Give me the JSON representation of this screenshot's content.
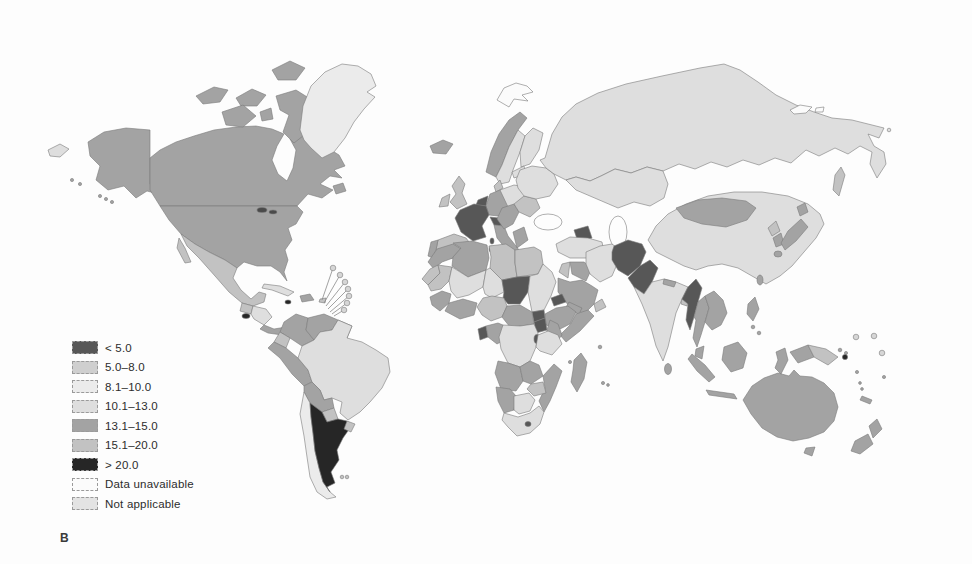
{
  "figure": {
    "panel_label": "B"
  },
  "legend": {
    "items": [
      {
        "label": "< 5.0",
        "color": "#575757"
      },
      {
        "label": "5.0–8.0",
        "color": "#cfcfcf"
      },
      {
        "label": "8.1–10.0",
        "color": "#ebebeb"
      },
      {
        "label": "10.1–13.0",
        "color": "#dedede"
      },
      {
        "label": "13.1–15.0",
        "color": "#a3a3a3"
      },
      {
        "label": "15.1–20.0",
        "color": "#c2c2c2"
      },
      {
        "label": "> 20.0",
        "color": "#262626"
      },
      {
        "label": "Data unavailable",
        "color": "#fbfbfb"
      },
      {
        "label": "Not applicable",
        "color": "#e3e3e3"
      }
    ]
  },
  "map": {
    "ocean_color": "#fdfdfd",
    "border_color": "#7a7a7a",
    "water": {
      "black_sea": "#fdfdfd",
      "caspian_sea": "#fdfdfd",
      "great_lakes": "#4a4a4a"
    },
    "markers": {
      "small_island_circle": {
        "fill": "#d6d6d6"
      },
      "dark_island_circle": {
        "fill": "#262626"
      }
    },
    "regions": {
      "alaska": {
        "name": "Alaska",
        "category": "13.1–15.0",
        "fill": "#a3a3a3"
      },
      "canada": {
        "name": "Canada",
        "category": "13.1–15.0",
        "fill": "#a3a3a3"
      },
      "arctic_islands": {
        "name": "Canadian Arctic islands",
        "category": "13.1–15.0",
        "fill": "#a3a3a3"
      },
      "greenland": {
        "name": "Greenland",
        "category": "8.1–10.0",
        "fill": "#ebebeb"
      },
      "usa": {
        "name": "United States",
        "category": "13.1–15.0",
        "fill": "#a3a3a3"
      },
      "mexico": {
        "name": "Mexico",
        "category": "15.1–20.0",
        "fill": "#c2c2c2"
      },
      "guatemala": {
        "name": "Guatemala",
        "category": "15.1–20.0",
        "fill": "#c2c2c2"
      },
      "el_salvador": {
        "name": "El Salvador",
        "category": "> 20.0",
        "fill": "#262626"
      },
      "honduras_nicaragua": {
        "name": "Honduras / Nicaragua",
        "category": "10.1–13.0",
        "fill": "#dedede"
      },
      "costa_rica_panama": {
        "name": "Costa Rica / Panama",
        "category": "13.1–15.0",
        "fill": "#a3a3a3"
      },
      "cuba": {
        "name": "Cuba",
        "category": "10.1–13.0",
        "fill": "#dedede"
      },
      "hispaniola": {
        "name": "Hispaniola",
        "category": "13.1–15.0",
        "fill": "#a3a3a3"
      },
      "jamaica": {
        "name": "Jamaica",
        "category": "> 20.0",
        "fill": "#262626"
      },
      "puerto_rico": {
        "name": "Puerto Rico",
        "category": "15.1–20.0",
        "fill": "#c2c2c2"
      },
      "colombia": {
        "name": "Colombia",
        "category": "13.1–15.0",
        "fill": "#a3a3a3"
      },
      "venezuela": {
        "name": "Venezuela",
        "category": "13.1–15.0",
        "fill": "#a3a3a3"
      },
      "guyanas": {
        "name": "Guyanas",
        "category": "13.1–15.0",
        "fill": "#a3a3a3"
      },
      "ecuador": {
        "name": "Ecuador",
        "category": "15.1–20.0",
        "fill": "#c2c2c2"
      },
      "peru": {
        "name": "Peru",
        "category": "13.1–15.0",
        "fill": "#a3a3a3"
      },
      "brazil": {
        "name": "Brazil",
        "category": "10.1–13.0",
        "fill": "#dedede"
      },
      "bolivia": {
        "name": "Bolivia",
        "category": "13.1–15.0",
        "fill": "#a3a3a3"
      },
      "paraguay": {
        "name": "Paraguay",
        "category": "15.1–20.0",
        "fill": "#c2c2c2"
      },
      "chile": {
        "name": "Chile",
        "category": "8.1–10.0",
        "fill": "#ebebeb"
      },
      "argentina": {
        "name": "Argentina",
        "category": "> 20.0",
        "fill": "#262626"
      },
      "uruguay": {
        "name": "Uruguay",
        "category": "15.1–20.0",
        "fill": "#c2c2c2"
      },
      "falklands": {
        "name": "Falkland Islands",
        "category": "15.1–20.0",
        "fill": "#c2c2c2"
      },
      "iceland": {
        "name": "Iceland",
        "category": "13.1–15.0",
        "fill": "#a3a3a3"
      },
      "svalbard": {
        "name": "Svalbard",
        "category": "Data unavailable",
        "fill": "#fbfbfb"
      },
      "uk": {
        "name": "United Kingdom",
        "category": "15.1–20.0",
        "fill": "#c2c2c2"
      },
      "ireland": {
        "name": "Ireland",
        "category": "15.1–20.0",
        "fill": "#c2c2c2"
      },
      "norway": {
        "name": "Norway",
        "category": "13.1–15.0",
        "fill": "#a3a3a3"
      },
      "sweden": {
        "name": "Sweden",
        "category": "10.1–13.0",
        "fill": "#dedede"
      },
      "finland": {
        "name": "Finland",
        "category": "10.1–13.0",
        "fill": "#dedede"
      },
      "denmark": {
        "name": "Denmark",
        "category": "15.1–20.0",
        "fill": "#c2c2c2"
      },
      "france": {
        "name": "France",
        "category": "< 5.0",
        "fill": "#575757"
      },
      "benelux": {
        "name": "Belgium / Netherlands",
        "category": "< 5.0",
        "fill": "#575757"
      },
      "germany": {
        "name": "Germany",
        "category": "13.1–15.0",
        "fill": "#a3a3a3"
      },
      "spain": {
        "name": "Spain",
        "category": "15.1–20.0",
        "fill": "#c2c2c2"
      },
      "portugal": {
        "name": "Portugal",
        "category": "13.1–15.0",
        "fill": "#a3a3a3"
      },
      "italy": {
        "name": "Italy",
        "category": "13.1–15.0",
        "fill": "#a3a3a3"
      },
      "alpine": {
        "name": "Switzerland / Austria",
        "category": "< 5.0",
        "fill": "#575757"
      },
      "corsica_sardinia": {
        "name": "Corsica / Sardinia",
        "category": "< 5.0",
        "fill": "#575757"
      },
      "central_europe": {
        "name": "Poland / Central Europe",
        "category": "10.1–13.0",
        "fill": "#dedede"
      },
      "balkans": {
        "name": "Balkans",
        "category": "13.1–15.0",
        "fill": "#a3a3a3"
      },
      "greece": {
        "name": "Greece",
        "category": "13.1–15.0",
        "fill": "#a3a3a3"
      },
      "romania_bulgaria": {
        "name": "Romania / Bulgaria",
        "category": "15.1–20.0",
        "fill": "#c2c2c2"
      },
      "ukraine": {
        "name": "Ukraine / Belarus",
        "category": "10.1–13.0",
        "fill": "#dedede"
      },
      "baltics": {
        "name": "Baltic states",
        "category": "10.1–13.0",
        "fill": "#dedede"
      },
      "russia": {
        "name": "Russia",
        "category": "10.1–13.0",
        "fill": "#dedede"
      },
      "chukotka": {
        "name": "Chukotka (edge wrap)",
        "category": "10.1–13.0",
        "fill": "#dedede"
      },
      "sakhalin": {
        "name": "Sakhalin",
        "category": "15.1–20.0",
        "fill": "#c2c2c2"
      },
      "new_siberian": {
        "name": "New Siberian Islands",
        "category": "Data unavailable",
        "fill": "#fbfbfb"
      },
      "kazakhstan": {
        "name": "Kazakhstan",
        "category": "10.1–13.0",
        "fill": "#dedede"
      },
      "kyrgyzstan": {
        "name": "Kyrgyzstan / Tajikistan",
        "category": "< 5.0",
        "fill": "#575757"
      },
      "caucasus": {
        "name": "Caucasus states",
        "category": "< 5.0",
        "fill": "#575757"
      },
      "turkey": {
        "name": "Turkey",
        "category": "10.1–13.0",
        "fill": "#dedede"
      },
      "levant": {
        "name": "Syria / Levant",
        "category": "15.1–20.0",
        "fill": "#c2c2c2"
      },
      "iraq": {
        "name": "Iraq",
        "category": "13.1–15.0",
        "fill": "#a3a3a3"
      },
      "saudi_arabia": {
        "name": "Saudi Arabia",
        "category": "13.1–15.0",
        "fill": "#a3a3a3"
      },
      "yemen": {
        "name": "Yemen",
        "category": "13.1–15.0",
        "fill": "#a3a3a3"
      },
      "oman": {
        "name": "Oman",
        "category": "15.1–20.0",
        "fill": "#c2c2c2"
      },
      "iran": {
        "name": "Iran",
        "category": "10.1–13.0",
        "fill": "#dedede"
      },
      "afghanistan": {
        "name": "Afghanistan",
        "category": "< 5.0",
        "fill": "#575757"
      },
      "pakistan": {
        "name": "Pakistan",
        "category": "< 5.0",
        "fill": "#575757"
      },
      "india": {
        "name": "India",
        "category": "10.1–13.0",
        "fill": "#dedede"
      },
      "nepal": {
        "name": "Nepal",
        "category": "13.1–15.0",
        "fill": "#a3a3a3"
      },
      "bangladesh": {
        "name": "Bangladesh",
        "category": "15.1–20.0",
        "fill": "#c2c2c2"
      },
      "sri_lanka": {
        "name": "Sri Lanka",
        "category": "13.1–15.0",
        "fill": "#a3a3a3"
      },
      "myanmar": {
        "name": "Myanmar",
        "category": "< 5.0",
        "fill": "#575757"
      },
      "thailand": {
        "name": "Thailand",
        "category": "13.1–15.0",
        "fill": "#a3a3a3"
      },
      "indochina": {
        "name": "Vietnam / Laos / Cambodia",
        "category": "13.1–15.0",
        "fill": "#a3a3a3"
      },
      "malaysia": {
        "name": "Malaysia",
        "category": "13.1–15.0",
        "fill": "#a3a3a3"
      },
      "sumatra": {
        "name": "Sumatra (Indonesia)",
        "category": "13.1–15.0",
        "fill": "#a3a3a3"
      },
      "java": {
        "name": "Java (Indonesia)",
        "category": "13.1–15.0",
        "fill": "#a3a3a3"
      },
      "borneo": {
        "name": "Borneo",
        "category": "13.1–15.0",
        "fill": "#a3a3a3"
      },
      "sulawesi": {
        "name": "Sulawesi",
        "category": "13.1–15.0",
        "fill": "#a3a3a3"
      },
      "timor": {
        "name": "Timor",
        "category": "13.1–15.0",
        "fill": "#a3a3a3"
      },
      "philippines": {
        "name": "Philippines",
        "category": "13.1–15.0",
        "fill": "#a3a3a3"
      },
      "papua_west": {
        "name": "Papua (Indonesia)",
        "category": "13.1–15.0",
        "fill": "#a3a3a3"
      },
      "papua_new_guinea": {
        "name": "Papua New Guinea",
        "category": "15.1–20.0",
        "fill": "#c2c2c2"
      },
      "china": {
        "name": "China",
        "category": "10.1–13.0",
        "fill": "#dedede"
      },
      "mongolia": {
        "name": "Mongolia",
        "category": "13.1–15.0",
        "fill": "#a3a3a3"
      },
      "north_korea": {
        "name": "North Korea",
        "category": "15.1–20.0",
        "fill": "#c2c2c2"
      },
      "south_korea": {
        "name": "South Korea",
        "category": "13.1–15.0",
        "fill": "#a3a3a3"
      },
      "japan": {
        "name": "Japan",
        "category": "13.1–15.0",
        "fill": "#a3a3a3"
      },
      "taiwan": {
        "name": "Taiwan",
        "category": "13.1–15.0",
        "fill": "#a3a3a3"
      },
      "morocco": {
        "name": "Morocco",
        "category": "13.1–15.0",
        "fill": "#a3a3a3"
      },
      "western_sahara": {
        "name": "Western Sahara",
        "category": "15.1–20.0",
        "fill": "#c2c2c2"
      },
      "algeria": {
        "name": "Algeria",
        "category": "13.1–15.0",
        "fill": "#a3a3a3"
      },
      "libya": {
        "name": "Libya",
        "category": "15.1–20.0",
        "fill": "#c2c2c2"
      },
      "egypt": {
        "name": "Egypt",
        "category": "15.1–20.0",
        "fill": "#c2c2c2"
      },
      "mauritania": {
        "name": "Mauritania",
        "category": "15.1–20.0",
        "fill": "#c2c2c2"
      },
      "mali": {
        "name": "Mali",
        "category": "10.1–13.0",
        "fill": "#dedede"
      },
      "niger": {
        "name": "Niger",
        "category": "10.1–13.0",
        "fill": "#dedede"
      },
      "chad": {
        "name": "Chad",
        "category": "< 5.0",
        "fill": "#575757"
      },
      "sudan": {
        "name": "Sudan",
        "category": "10.1–13.0",
        "fill": "#dedede"
      },
      "eritrea": {
        "name": "Eritrea / Djibouti",
        "category": "< 5.0",
        "fill": "#575757"
      },
      "ethiopia": {
        "name": "Ethiopia",
        "category": "13.1–15.0",
        "fill": "#a3a3a3"
      },
      "somalia": {
        "name": "Somalia",
        "category": "13.1–15.0",
        "fill": "#a3a3a3"
      },
      "south_sudan": {
        "name": "South Sudan",
        "category": "< 5.0",
        "fill": "#575757"
      },
      "uganda": {
        "name": "Uganda",
        "category": "< 5.0",
        "fill": "#575757"
      },
      "kenya": {
        "name": "Kenya",
        "category": "13.1–15.0",
        "fill": "#a3a3a3"
      },
      "senegal_guinea": {
        "name": "Senegal / Guinea",
        "category": "13.1–15.0",
        "fill": "#a3a3a3"
      },
      "ivory_ghana": {
        "name": "Côte d'Ivoire / Ghana",
        "category": "13.1–15.0",
        "fill": "#a3a3a3"
      },
      "nigeria": {
        "name": "Nigeria",
        "category": "15.1–20.0",
        "fill": "#c2c2c2"
      },
      "cameroon_car": {
        "name": "Cameroon / CAR",
        "category": "13.1–15.0",
        "fill": "#a3a3a3"
      },
      "equatorial_guinea": {
        "name": "Equatorial Guinea / Gabon coast",
        "category": "< 5.0",
        "fill": "#575757"
      },
      "congo": {
        "name": "Congo",
        "category": "13.1–15.0",
        "fill": "#a3a3a3"
      },
      "drc": {
        "name": "DR Congo",
        "category": "10.1–13.0",
        "fill": "#dedede"
      },
      "rwanda_burundi": {
        "name": "Rwanda / Burundi",
        "category": "< 5.0",
        "fill": "#575757"
      },
      "tanzania": {
        "name": "Tanzania",
        "category": "10.1–13.0",
        "fill": "#dedede"
      },
      "angola": {
        "name": "Angola",
        "category": "13.1–15.0",
        "fill": "#a3a3a3"
      },
      "zambia": {
        "name": "Zambia",
        "category": "13.1–15.0",
        "fill": "#a3a3a3"
      },
      "zimbabwe": {
        "name": "Zimbabwe",
        "category": "15.1–20.0",
        "fill": "#c2c2c2"
      },
      "mozambique": {
        "name": "Mozambique",
        "category": "13.1–15.0",
        "fill": "#a3a3a3"
      },
      "namibia": {
        "name": "Namibia",
        "category": "13.1–15.0",
        "fill": "#a3a3a3"
      },
      "botswana": {
        "name": "Botswana",
        "category": "10.1–13.0",
        "fill": "#dedede"
      },
      "south_africa": {
        "name": "South Africa",
        "category": "10.1–13.0",
        "fill": "#dedede"
      },
      "lesotho": {
        "name": "Lesotho",
        "category": "< 5.0",
        "fill": "#575757"
      },
      "madagascar": {
        "name": "Madagascar",
        "category": "13.1–15.0",
        "fill": "#a3a3a3"
      },
      "indian_ocean_islands": {
        "name": "Indian Ocean islands",
        "category": "13.1–15.0",
        "fill": "#a3a3a3"
      },
      "australia": {
        "name": "Australia",
        "category": "13.1–15.0",
        "fill": "#a3a3a3"
      },
      "tasmania": {
        "name": "Tasmania",
        "category": "13.1–15.0",
        "fill": "#a3a3a3"
      },
      "new_zealand": {
        "name": "New Zealand",
        "category": "13.1–15.0",
        "fill": "#a3a3a3"
      },
      "new_caledonia": {
        "name": "New Caledonia",
        "category": "13.1–15.0",
        "fill": "#a3a3a3"
      },
      "solomon_vanuatu": {
        "name": "Solomon Is. / Vanuatu",
        "category": "13.1–15.0",
        "fill": "#a3a3a3"
      },
      "hawaii": {
        "name": "Hawaii",
        "category": "13.1–15.0",
        "fill": "#a3a3a3"
      }
    }
  }
}
